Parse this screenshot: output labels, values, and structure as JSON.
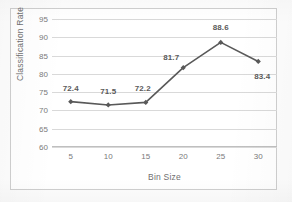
{
  "chart_data": {
    "type": "line",
    "title": "",
    "xlabel": "Bin Size",
    "ylabel": "Classification Rate",
    "categories": [
      "5",
      "10",
      "15",
      "20",
      "25",
      "30"
    ],
    "values": [
      72.4,
      71.5,
      72.2,
      81.7,
      88.6,
      83.4
    ],
    "point_labels": [
      "72.4",
      "71.5",
      "72.2",
      "81.7",
      "88.6",
      "83.4"
    ],
    "ylim": [
      60,
      95
    ],
    "y_ticks": [
      "95",
      "90",
      "85",
      "80",
      "75",
      "70",
      "65",
      "60"
    ],
    "y_tick_values": [
      95,
      90,
      85,
      80,
      75,
      70,
      65,
      60
    ],
    "grid": "horizontal",
    "legend": "none",
    "series_color": "#595959",
    "gridline_color": "#d9d9d9",
    "marker": "diamond",
    "label_offsets": [
      {
        "dx": 0,
        "dy": -14
      },
      {
        "dx": 0,
        "dy": -14
      },
      {
        "dx": -3,
        "dy": -14
      },
      {
        "dx": -12,
        "dy": -11
      },
      {
        "dx": 0,
        "dy": -15
      },
      {
        "dx": 4,
        "dy": 15
      }
    ]
  }
}
